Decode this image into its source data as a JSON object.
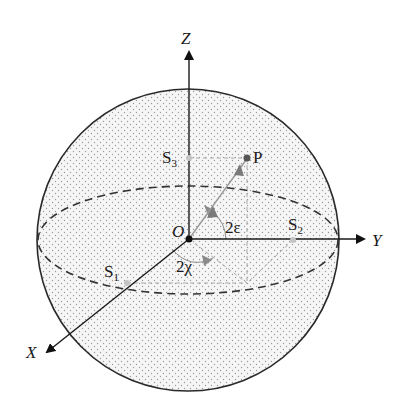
{
  "figure": {
    "colors": {
      "background": "#ffffff",
      "sphere_fill": "#f4f4f4",
      "dots": "#9a9a9a",
      "outline": "#2a2a2a",
      "axis": "#1a1a1a",
      "vector": "#9a9a9a",
      "points_gray": "#bdbdbd",
      "point_P": "#555555"
    },
    "axes": {
      "x": {
        "label": "X"
      },
      "y": {
        "label": "Y"
      },
      "z": {
        "label": "Z"
      }
    },
    "origin": {
      "label": "O"
    },
    "point": {
      "label": "P"
    },
    "components": [
      {
        "base": "S",
        "sub": "1"
      },
      {
        "base": "S",
        "sub": "2"
      },
      {
        "base": "S",
        "sub": "3"
      }
    ],
    "angles": {
      "ellipticity": "2ε",
      "azimuth": "2χ"
    }
  }
}
